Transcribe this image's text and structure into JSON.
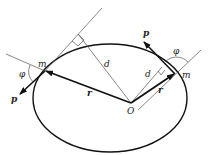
{
  "diagram": {
    "labels": {
      "mass_left": "m",
      "mass_right": "m",
      "momentum_left": "p",
      "momentum_right": "p",
      "radius_left": "r",
      "radius_right": "r",
      "distance_left": "d",
      "distance_right": "d",
      "angle_left": "φ",
      "angle_right": "φ",
      "origin": "O"
    },
    "colors": {
      "stroke": "#111111",
      "thin": "#555555",
      "background": "#ffffff"
    }
  }
}
